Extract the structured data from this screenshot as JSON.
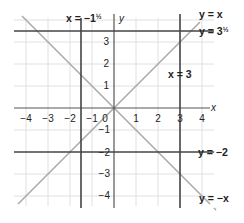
{
  "diagram": {
    "type": "coordinate-graph",
    "origin_px": [
      114,
      108
    ],
    "unit_px": 22,
    "x_axis": {
      "label": "x",
      "ticks": [
        "−4",
        "−3",
        "−2",
        "−1",
        "1",
        "2",
        "3",
        "4"
      ]
    },
    "y_axis": {
      "label": "y",
      "ticks_positive": [
        "1",
        "2",
        "3"
      ],
      "ticks_negative": [
        "−1",
        "−2",
        "−3",
        "−4"
      ]
    },
    "origin_label": "0",
    "lines": [
      {
        "id": "x_eq_neg1_5",
        "label_prefix": "x = −1",
        "label_frac": "½",
        "kind": "vertical",
        "value": -1.5,
        "color": "#444444"
      },
      {
        "id": "x_eq_3",
        "label": "x = 3",
        "kind": "vertical",
        "value": 3,
        "color": "#444444"
      },
      {
        "id": "y_eq_3_5",
        "label_prefix": "y = 3",
        "label_frac": "½",
        "kind": "horizontal",
        "value": 3.5,
        "color": "#444444"
      },
      {
        "id": "y_eq_neg2",
        "label": "y = −2",
        "kind": "horizontal",
        "value": -2,
        "color": "#444444"
      },
      {
        "id": "y_eq_x",
        "label": "y = x",
        "kind": "diagonal",
        "slope": 1,
        "color": "#aaaaaa"
      },
      {
        "id": "y_eq_negx",
        "label": "y = −x",
        "kind": "diagonal",
        "slope": -1,
        "color": "#aaaaaa"
      }
    ],
    "colors": {
      "grid": "#dddddd",
      "axis": "#555555",
      "dark_line": "#444444",
      "diagonal": "#aaaaaa",
      "text": "#222222"
    }
  }
}
